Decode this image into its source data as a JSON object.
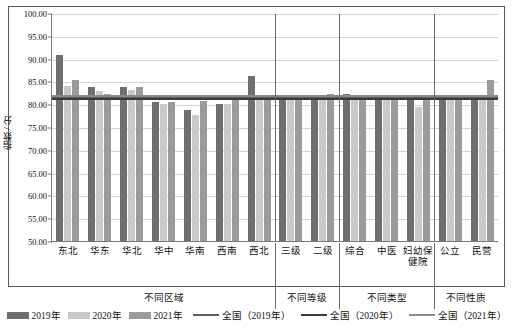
{
  "chart_data": {
    "type": "bar",
    "title": "",
    "xlabel": "",
    "ylabel": "指数 / 分",
    "ylim": [
      50.0,
      100.0
    ],
    "ytick_step": 5.0,
    "ytick_labels": [
      "100.00",
      "95.00",
      "90.00",
      "85.00",
      "80.00",
      "75.00",
      "70.00",
      "65.00",
      "60.00",
      "55.00",
      "50.00"
    ],
    "grid": true,
    "legend_position": "bottom",
    "categories": [
      "东北",
      "华东",
      "华北",
      "华中",
      "华南",
      "西南",
      "西北",
      "三级",
      "二级",
      "综合",
      "中医",
      "妇幼保健院",
      "公立",
      "民营"
    ],
    "series": [
      {
        "name": "2019年",
        "color": "#6f6f6f",
        "values": [
          91.0,
          83.9,
          84.0,
          80.6,
          79.0,
          80.3,
          86.5,
          82.2,
          82.2,
          82.5,
          81.2,
          81.3,
          82.2,
          82.1
        ]
      },
      {
        "name": "2020年",
        "color": "#c9c9c9",
        "values": [
          84.2,
          83.2,
          83.3,
          80.3,
          77.9,
          80.2,
          81.4,
          81.9,
          82.1,
          82.0,
          81.5,
          79.6,
          81.8,
          82.1
        ]
      },
      {
        "name": "2021年",
        "color": "#9b9b9b",
        "values": [
          85.6,
          82.5,
          84.0,
          80.8,
          80.9,
          81.8,
          82.2,
          82.3,
          82.4,
          82.3,
          82.2,
          82.2,
          82.2,
          85.5
        ]
      }
    ],
    "reference_lines": [
      {
        "name": "全国（2019年）",
        "color": "#5e5e5e",
        "value": 81.7
      },
      {
        "name": "全国（2020年）",
        "color": "#3a3a3a",
        "value": 81.5
      },
      {
        "name": "全国（2021年）",
        "color": "#8a8a8a",
        "value": 82.2
      }
    ],
    "category_groups": [
      {
        "label": "不同区域",
        "span": 7
      },
      {
        "label": "不同等级",
        "span": 2
      },
      {
        "label": "不同类型",
        "span": 3
      },
      {
        "label": "不同性质",
        "span": 2
      }
    ]
  },
  "legend": {
    "items": [
      {
        "label": "2019年",
        "type": "bar",
        "swatch": "s2019"
      },
      {
        "label": "2020年",
        "type": "bar",
        "swatch": "s2020"
      },
      {
        "label": "2021年",
        "type": "bar",
        "swatch": "s2021"
      },
      {
        "label": "全国（2019年）",
        "type": "line",
        "swatch": "l2019"
      },
      {
        "label": "全国（2020年）",
        "type": "line",
        "swatch": "l2020"
      },
      {
        "label": "全国（2021年）",
        "type": "line",
        "swatch": "l2021"
      }
    ]
  }
}
